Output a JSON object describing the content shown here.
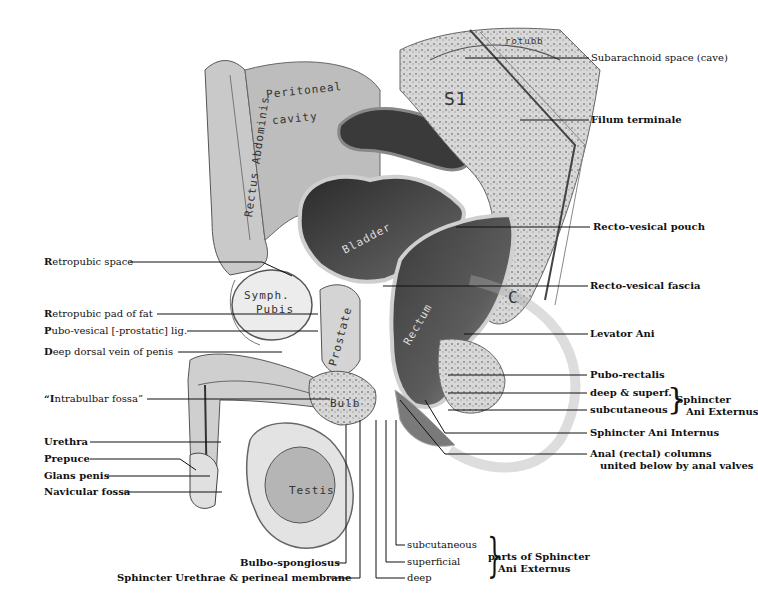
{
  "figure": {
    "inline_labels": {
      "rectus_abdominis": "Rectus Abdominis",
      "peritoneal": "Peritoneal",
      "cavity": "cavity",
      "bladder": "Bladder",
      "symph": "Symph.",
      "pubis": "Pubis",
      "prostate": "Prostate",
      "rectum": "Rectum",
      "bulb": "Bulb",
      "testis": "Testis",
      "s1": "S1",
      "c": "C",
      "rotubb": "rotubb"
    },
    "left_labels": [
      {
        "id": "retropubic-space",
        "bold": "R",
        "text": "etropubic space"
      },
      {
        "id": "retropubic-pad",
        "bold": "R",
        "text": "etropubic pad of fat"
      },
      {
        "id": "pubo-vesical",
        "bold": "P",
        "text": "ubo-vesical [-prostatic] lig."
      },
      {
        "id": "deep-dorsal-vein",
        "bold": "D",
        "text": "eep dorsal vein of penis"
      },
      {
        "id": "intrabulbar-fossa",
        "bold": "“I",
        "text": "ntrabulbar fossa”"
      },
      {
        "id": "urethra",
        "bold": "U",
        "text": "rethra"
      },
      {
        "id": "prepuce",
        "bold": "P",
        "text": "repuce"
      },
      {
        "id": "glans-penis",
        "bold": "G",
        "text": "lans penis"
      },
      {
        "id": "navicular-fossa",
        "bold": "N",
        "text": "avicular fossa"
      }
    ],
    "right_labels": [
      {
        "id": "subarachnoid",
        "text": "Subarachnoid space (cave)"
      },
      {
        "id": "filum",
        "text": "Filum terminale"
      },
      {
        "id": "recto-vesical-pouch",
        "text": "Recto-vesical pouch"
      },
      {
        "id": "recto-vesical-fascia",
        "text": "Recto-vesical fascia"
      },
      {
        "id": "levator-ani",
        "text": "Levator Ani"
      },
      {
        "id": "pubo-rectalis",
        "text": "Pubo-rectalis"
      },
      {
        "id": "deep-superf",
        "text": "deep & superf."
      },
      {
        "id": "subcutaneous-r",
        "text": "subcutaneous"
      },
      {
        "id": "sphincter-ani-internus",
        "text": "Sphincter Ani Internus"
      },
      {
        "id": "anal-columns-1",
        "text": "Anal (rectal) columns"
      },
      {
        "id": "anal-columns-2",
        "text": "united below by anal valves"
      }
    ],
    "sphincter_group": {
      "line1": "Sphincter",
      "line2": "Ani Externus"
    },
    "bottom_labels": [
      {
        "id": "bulbo-spongiosus",
        "text": "Bulbo-spongiosus"
      },
      {
        "id": "sphincter-urethrae",
        "text": "Sphincter Urethrae & perineal membrane"
      },
      {
        "id": "subcutaneous-b",
        "text": "subcutaneous"
      },
      {
        "id": "superficial",
        "text": "superficial"
      },
      {
        "id": "deep",
        "text": "deep"
      }
    ],
    "parts_group": {
      "line1": "parts of Sphincter",
      "line2": "Ani Externus"
    }
  }
}
